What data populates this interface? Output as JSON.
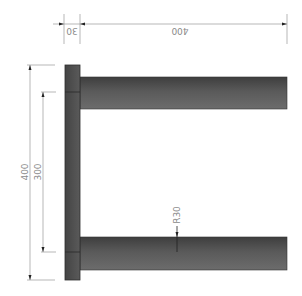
{
  "drawing": {
    "type": "technical-drawing",
    "dimensions": {
      "top_overall": "400",
      "top_plate_thickness": "30",
      "left_overall": "400",
      "left_rod_spacing": "300",
      "rod_radius": "R30"
    },
    "colors": {
      "part_dark": "#4a4a4a",
      "part_light": "#6e6e6e",
      "dimension_line": "#9a9a9a",
      "dimension_text": "#8a8a8a",
      "background": "#ffffff"
    }
  }
}
